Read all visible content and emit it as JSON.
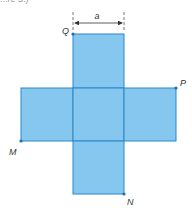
{
  "figure": {
    "caption_fragment": "...re 5.)",
    "dimension_label": "a",
    "points": {
      "Q": "Q",
      "P": "P",
      "M": "M",
      "N": "N"
    },
    "squares_count": 6,
    "colors": {
      "fill": "#86C7EF",
      "stroke": "#2B87C9",
      "point": "#1F6FB0",
      "text": "#333333"
    }
  }
}
